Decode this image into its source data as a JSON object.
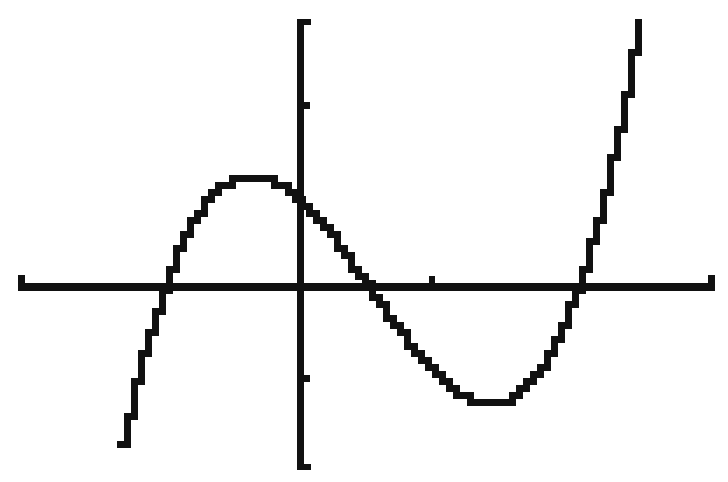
{
  "chart_data": {
    "type": "line",
    "title": "",
    "xlabel": "",
    "ylabel": "",
    "grid": false,
    "legend": null,
    "style": "graphing-calculator pixel plot, black on white",
    "colors": {
      "background": "#ffffff",
      "ink": "#111111"
    },
    "function_estimate": "y ≈ 0.85(x + 1.05)(x − 0.52)(x − 2.08)",
    "xlim": [
      -2.14,
      3.14
    ],
    "ylim": [
      -2.02,
      2.94
    ],
    "x_tick_spacing": 1,
    "y_tick_spacing": 1,
    "x_ticks_visible": [
      1
    ],
    "y_ticks_visible": [
      2,
      -1
    ],
    "roots": [
      -1.05,
      0.52,
      2.08
    ],
    "y_intercept": 0.96,
    "local_max": {
      "x": -0.41,
      "y": 1.26
    },
    "local_min": {
      "x": 1.42,
      "y": -1.27
    },
    "x": [
      -1.39,
      -1.3,
      -1.2,
      -1.05,
      -0.9,
      -0.75,
      -0.6,
      -0.41,
      -0.2,
      0.0,
      0.2,
      0.4,
      0.52,
      0.7,
      0.9,
      1.1,
      1.3,
      1.42,
      1.6,
      1.8,
      2.0,
      2.08,
      2.2,
      2.35,
      2.55
    ],
    "values": [
      -2.0,
      -1.45,
      -0.74,
      0.0,
      0.56,
      0.97,
      1.19,
      1.26,
      1.15,
      0.96,
      0.68,
      0.22,
      0.0,
      -0.4,
      -0.81,
      -1.11,
      -1.26,
      -1.27,
      -1.11,
      -0.73,
      -0.22,
      0.0,
      0.36,
      1.0,
      2.93
    ]
  },
  "pixel_map": {
    "origin_x": 300,
    "origin_y": 287,
    "px_per_x_unit": 132,
    "px_per_y_unit": 91,
    "x_axis": {
      "x1": 18,
      "x2": 715,
      "y": 287,
      "thickness": 8
    },
    "y_axis": {
      "x": 300,
      "y1": 19,
      "y2": 470,
      "thickness": 7
    },
    "curve_pixel": 7
  }
}
